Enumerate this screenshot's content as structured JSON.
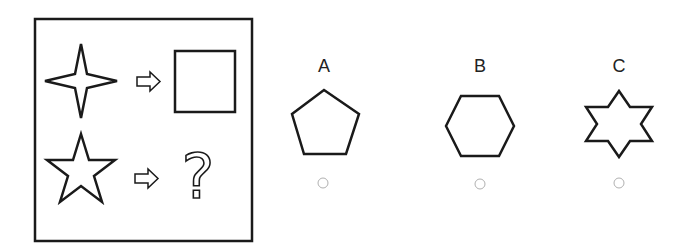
{
  "puzzle": {
    "prompt_panel": {
      "rows": [
        {
          "source": "four-point-star",
          "relation": "arrow",
          "target": "square"
        },
        {
          "source": "five-point-star",
          "relation": "arrow",
          "target": "question-mark"
        }
      ],
      "question_glyph": "?"
    },
    "options": [
      {
        "label": "A",
        "shape": "pentagon",
        "selected": false
      },
      {
        "label": "B",
        "shape": "hexagon",
        "selected": false
      },
      {
        "label": "C",
        "shape": "six-point-star",
        "selected": false
      }
    ]
  },
  "colors": {
    "stroke": "#1a1a1a",
    "radio": "#b0b0b0",
    "background": "#ffffff"
  }
}
